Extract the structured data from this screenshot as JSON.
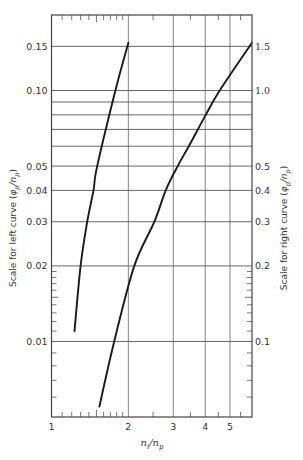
{
  "chart_data": {
    "type": "line",
    "title": "",
    "xlabel": "n_i/n_p",
    "xscale": "log",
    "xlim": [
      1,
      6.1
    ],
    "x_ticks": [
      1,
      2,
      3,
      4,
      5
    ],
    "x_tick_labels": [
      "1",
      "2",
      "3",
      "4",
      "5"
    ],
    "x_gridlines": [
      2,
      3,
      4,
      5
    ],
    "x_minor_ticks": [
      1.1,
      1.2,
      1.3,
      1.4,
      1.5,
      1.6,
      1.7,
      1.8,
      1.9,
      2.5,
      3.5,
      4.5,
      5.5
    ],
    "y_left": {
      "label": "Scale for left curve (φp/np)",
      "label_main": "Scale for left curve (",
      "label_var": "φ",
      "label_sub1": "p",
      "label_sep": "/n",
      "label_sub2": "p",
      "label_close": ")",
      "scale": "log",
      "ylim": [
        0.005,
        0.2
      ],
      "ticks": [
        0.01,
        0.02,
        0.03,
        0.04,
        0.05,
        0.1,
        0.15
      ],
      "tick_labels": [
        "0.01",
        "0.02",
        "0.03",
        "0.04",
        "0.05",
        "0.10",
        "0.15"
      ]
    },
    "y_right": {
      "label": "Scale for right curve (φp/np)",
      "label_main": "Scale for right curve (",
      "scale": "log",
      "ylim": [
        0.05,
        2.0
      ],
      "ticks": [
        0.1,
        0.2,
        0.3,
        0.4,
        0.5,
        1.0,
        1.5
      ],
      "tick_labels": [
        "0.1",
        "0.2",
        "0.3",
        "0.4",
        "0.5",
        "1.0",
        "1.5"
      ]
    },
    "y_gridlines_left_scale": [
      0.01,
      0.02,
      0.03,
      0.04,
      0.05,
      0.06,
      0.07,
      0.08,
      0.09,
      0.1,
      0.15
    ],
    "y_minor_ticks_left_scale": [
      0.006,
      0.007,
      0.008,
      0.009,
      0.011,
      0.012,
      0.013,
      0.014,
      0.015,
      0.016,
      0.017,
      0.018,
      0.019
    ],
    "grid": true,
    "legend": null,
    "series": [
      {
        "name": "Left curve",
        "axis": "left",
        "x": [
          1.23,
          1.3,
          1.38,
          1.46,
          1.51,
          1.78,
          2.0
        ],
        "y": [
          0.011,
          0.02,
          0.03,
          0.04,
          0.05,
          0.1,
          0.155
        ]
      },
      {
        "name": "Right curve",
        "axis": "right",
        "x": [
          1.54,
          1.76,
          2.11,
          2.53,
          2.8,
          3.12,
          3.45,
          4.02,
          4.56,
          6.1
        ],
        "y": [
          0.055,
          0.1,
          0.2,
          0.3,
          0.4,
          0.5,
          0.6,
          0.8,
          1.0,
          1.55
        ]
      }
    ]
  }
}
